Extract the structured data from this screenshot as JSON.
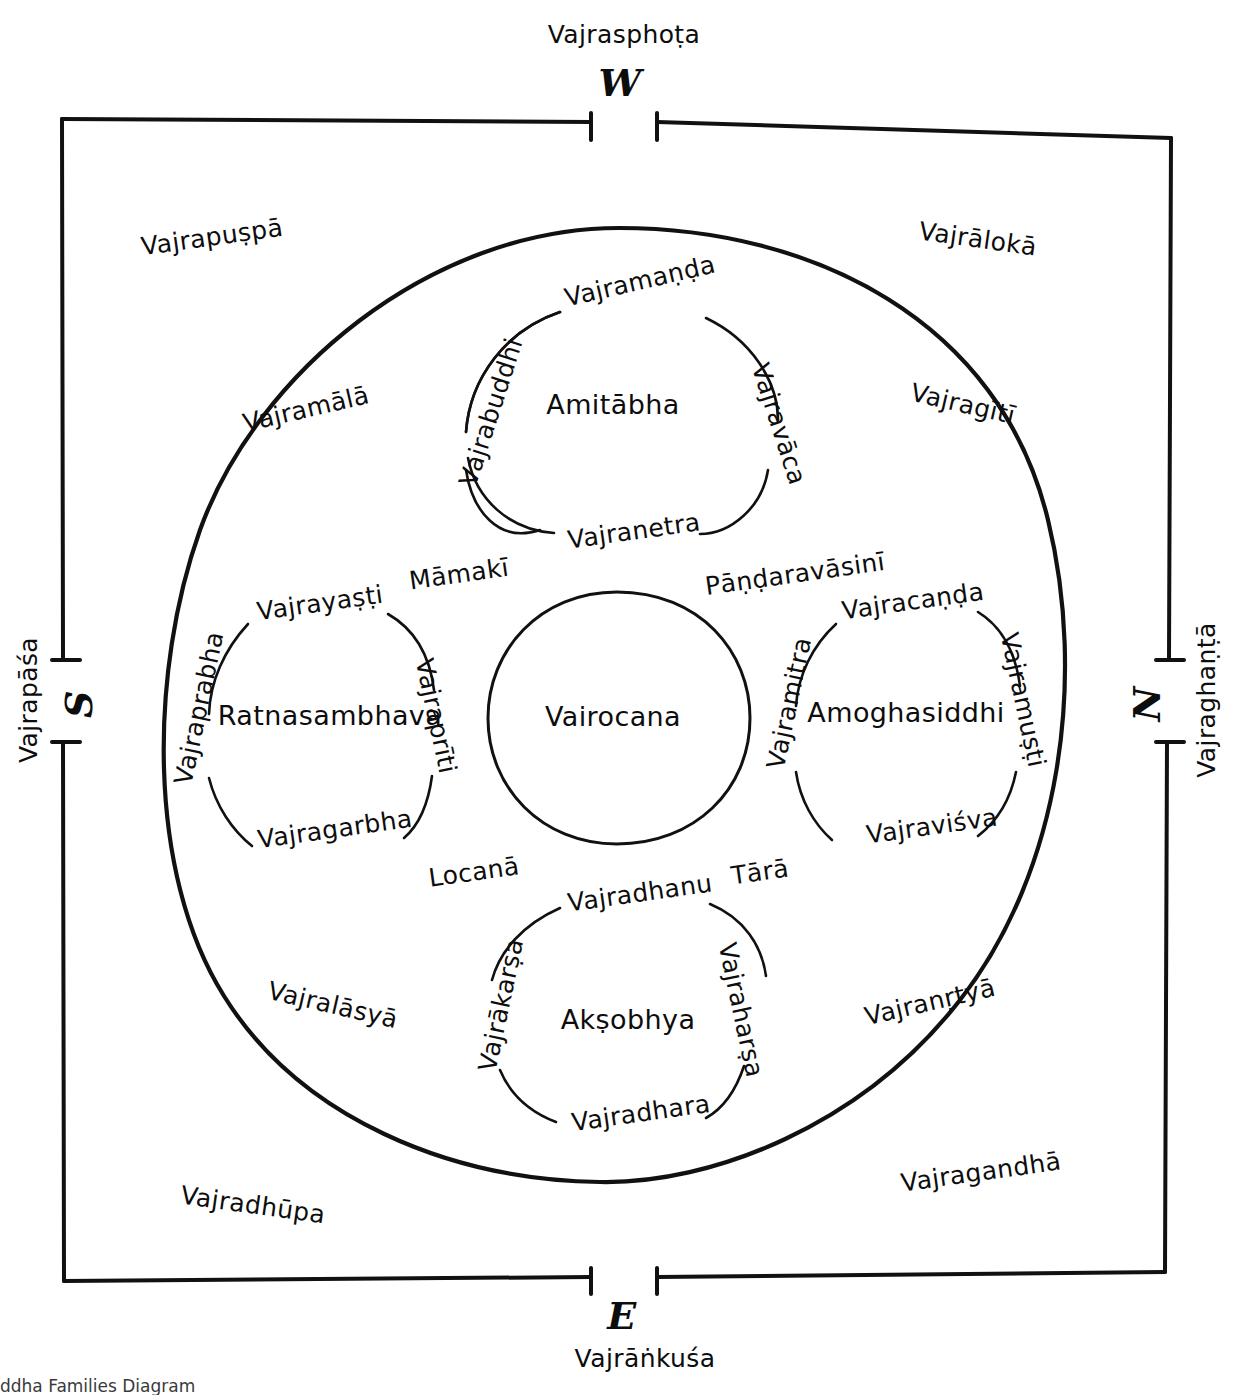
{
  "caption": "ddha Families Diagram",
  "frame": {
    "directions": {
      "west": "W",
      "east": "E",
      "south": "S",
      "north": "N"
    },
    "gate_deities": {
      "top": "Vajrasphoṭa",
      "bottom": "Vajrāṅkuśa",
      "left": "Vajrapāśa",
      "right": "Vajraghaṇṭā"
    }
  },
  "outer_offerings": {
    "top_left": "Vajrapuṣpā",
    "top_right": "Vajrālokā",
    "bottom_left": "Vajradhūpa",
    "bottom_right": "Vajragandhā"
  },
  "inner_offerings": {
    "upper_left": "Vajramālā",
    "upper_right": "Vajragītī",
    "lower_left": "Vajralāsyā",
    "lower_right": "Vajranṛtyā"
  },
  "center": {
    "buddha": "Vairocana"
  },
  "families": [
    {
      "id": "amitabha",
      "buddha": "Amitābha",
      "consort": "Pāṇḍaravāsinī",
      "top": "Vajramaṇḍa",
      "right": "Vajravāca",
      "bottom": "Vajranetra",
      "left": "Vajrabuddhi"
    },
    {
      "id": "ratnasambhava",
      "buddha": "Ratnasambhava",
      "consort": "Māmakī",
      "top": "Vajrayaṣṭi",
      "right": "Vajraprīti",
      "bottom": "Vajragarbha",
      "left": "Vajraprabha"
    },
    {
      "id": "amoghasiddhi",
      "buddha": "Amoghasiddhi",
      "consort": "Tārā",
      "top": "Vajracaṇḍa",
      "right": "Vajramuṣṭi",
      "bottom": "Vajraviśva",
      "left": "Vajramitra"
    },
    {
      "id": "aksobhya",
      "buddha": "Akṣobhya",
      "consort": "Locanā",
      "top": "Vajradhanu",
      "right": "Vajraharṣa",
      "bottom": "Vajradhara",
      "left": "Vajrākarṣa"
    }
  ],
  "consort_labels": {
    "mamaki": "Māmakī",
    "pandaravasini": "Pāṇḍaravāsinī",
    "locana": "Locanā",
    "tara": "Tārā"
  },
  "colors": {
    "ink": "#0d0d0d",
    "background": "#ffffff"
  }
}
